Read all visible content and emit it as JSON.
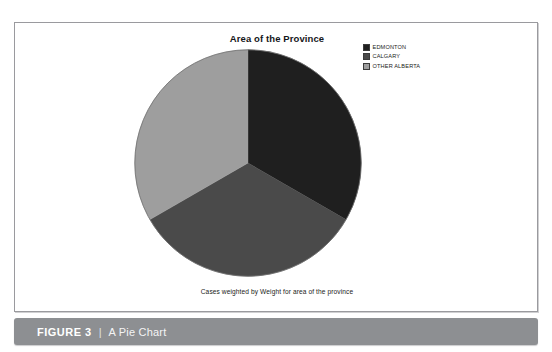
{
  "document": {
    "top_cropped_text": "",
    "figure": {
      "number_label": "FIGURE 3",
      "separator": "|",
      "caption": "A Pie Chart",
      "bar_color": "#8d8f92"
    }
  },
  "panel": {
    "border_color": "#9a9a9e",
    "background": "#ffffff"
  },
  "legend": {
    "items": [
      {
        "label": "EDMONTON",
        "color": "#1f1f1f"
      },
      {
        "label": "CALGARY",
        "color": "#4a4a4a"
      },
      {
        "label": "OTHER ALBERTA",
        "color": "#9e9e9e"
      }
    ]
  },
  "chart_data": {
    "type": "pie",
    "title": "Area of the Province",
    "subtitle": "",
    "annotation": "Cases weighted by Weight for area of the province",
    "xlabel": "",
    "ylabel": "",
    "grid": false,
    "legend_position": "top-right",
    "start_angle_deg": 0,
    "direction": "clockwise",
    "categories": [
      "EDMONTON",
      "CALGARY",
      "OTHER ALBERTA"
    ],
    "values": [
      33.3,
      33.3,
      33.3
    ],
    "unit": "percent",
    "colors": [
      "#1f1f1f",
      "#4a4a4a",
      "#9e9e9e"
    ],
    "slices": [
      {
        "label": "EDMONTON",
        "value": 33.3,
        "color": "#1f1f1f",
        "start_deg": 0,
        "end_deg": 120
      },
      {
        "label": "CALGARY",
        "value": 33.3,
        "color": "#4a4a4a",
        "start_deg": 120,
        "end_deg": 240
      },
      {
        "label": "OTHER ALBERTA",
        "value": 33.3,
        "color": "#9e9e9e",
        "start_deg": 240,
        "end_deg": 360
      }
    ]
  }
}
